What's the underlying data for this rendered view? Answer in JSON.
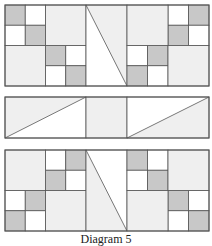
{
  "caption": "Diagram 5",
  "colors": {
    "gray": "#c8c8c8",
    "light": "#efefef",
    "white": "#ffffff",
    "stroke": "#555555"
  },
  "blocks": [
    {
      "name": "top-quilt-block",
      "y": 5,
      "h": 81,
      "sections": [
        {
          "x": 5,
          "w": 81,
          "type": "grid",
          "large": [
            {
              "col": 2,
              "row": 0
            },
            {
              "col": 0,
              "row": 2
            }
          ],
          "cells": [
            {
              "col": 0,
              "row": 0,
              "fill": "gray"
            },
            {
              "col": 1,
              "row": 0,
              "fill": "white"
            },
            {
              "col": 0,
              "row": 1,
              "fill": "white"
            },
            {
              "col": 1,
              "row": 1,
              "fill": "gray"
            },
            {
              "col": 2,
              "row": 2,
              "fill": "gray"
            },
            {
              "col": 3,
              "row": 2,
              "fill": "white"
            },
            {
              "col": 2,
              "row": 3,
              "fill": "white"
            },
            {
              "col": 3,
              "row": 3,
              "fill": "gray"
            }
          ]
        },
        {
          "x": 86,
          "w": 41,
          "type": "triangle",
          "diagonal": "tl-br",
          "shaded": "upper-right"
        },
        {
          "x": 127,
          "w": 82,
          "type": "grid",
          "large": [
            {
              "col": 0,
              "row": 0
            },
            {
              "col": 2,
              "row": 2
            }
          ],
          "cells": [
            {
              "col": 2,
              "row": 0,
              "fill": "white"
            },
            {
              "col": 3,
              "row": 0,
              "fill": "gray"
            },
            {
              "col": 2,
              "row": 1,
              "fill": "gray"
            },
            {
              "col": 3,
              "row": 1,
              "fill": "white"
            },
            {
              "col": 0,
              "row": 2,
              "fill": "white"
            },
            {
              "col": 1,
              "row": 2,
              "fill": "gray"
            },
            {
              "col": 0,
              "row": 3,
              "fill": "gray"
            },
            {
              "col": 1,
              "row": 3,
              "fill": "white"
            }
          ]
        }
      ]
    },
    {
      "name": "middle-sashing-strip",
      "y": 97,
      "h": 41,
      "sections": [
        {
          "x": 5,
          "w": 81,
          "type": "triangle",
          "diagonal": "bl-tr",
          "shaded": "upper-left"
        },
        {
          "x": 86,
          "w": 41,
          "type": "solid",
          "fill": "light"
        },
        {
          "x": 127,
          "w": 82,
          "type": "triangle",
          "diagonal": "bl-tr",
          "shaded": "lower-right"
        }
      ]
    },
    {
      "name": "bottom-quilt-block",
      "y": 150,
      "h": 81,
      "sections": [
        {
          "x": 5,
          "w": 81,
          "type": "grid",
          "large": [
            {
              "col": 0,
              "row": 0
            },
            {
              "col": 2,
              "row": 2
            }
          ],
          "cells": [
            {
              "col": 2,
              "row": 0,
              "fill": "white"
            },
            {
              "col": 3,
              "row": 0,
              "fill": "gray"
            },
            {
              "col": 2,
              "row": 1,
              "fill": "gray"
            },
            {
              "col": 3,
              "row": 1,
              "fill": "white"
            },
            {
              "col": 0,
              "row": 2,
              "fill": "white"
            },
            {
              "col": 1,
              "row": 2,
              "fill": "gray"
            },
            {
              "col": 0,
              "row": 3,
              "fill": "gray"
            },
            {
              "col": 1,
              "row": 3,
              "fill": "white"
            }
          ]
        },
        {
          "x": 86,
          "w": 41,
          "type": "triangle",
          "diagonal": "tl-br",
          "shaded": "lower-left"
        },
        {
          "x": 127,
          "w": 82,
          "type": "grid",
          "large": [
            {
              "col": 2,
              "row": 0
            },
            {
              "col": 0,
              "row": 2
            }
          ],
          "cells": [
            {
              "col": 0,
              "row": 0,
              "fill": "gray"
            },
            {
              "col": 1,
              "row": 0,
              "fill": "white"
            },
            {
              "col": 0,
              "row": 1,
              "fill": "white"
            },
            {
              "col": 1,
              "row": 1,
              "fill": "gray"
            },
            {
              "col": 2,
              "row": 2,
              "fill": "gray"
            },
            {
              "col": 3,
              "row": 2,
              "fill": "white"
            },
            {
              "col": 2,
              "row": 3,
              "fill": "white"
            },
            {
              "col": 3,
              "row": 3,
              "fill": "gray"
            }
          ]
        }
      ]
    }
  ]
}
